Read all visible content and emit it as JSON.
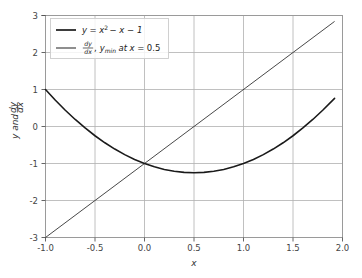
{
  "figure": {
    "background_color": "#ffffff",
    "axes_face_color": "#ffffff",
    "spine_color": "#aaaaaa",
    "grid_color": "#b0b0b0",
    "tick_color": "#555555",
    "curve_color": "#1a1a1a",
    "line_color": "#333333",
    "legend_face_color": "#ffffff",
    "legend_edge_color": "#cccccc"
  },
  "chart_data": {
    "type": "line",
    "title": "",
    "xlabel": "x",
    "ylabel": "y and dy/dx",
    "xlim": [
      -1.0,
      2.0
    ],
    "ylim": [
      -3.0,
      3.0
    ],
    "grid": true,
    "xticks": [
      -1.0,
      -0.5,
      0.0,
      0.5,
      1.0,
      1.5,
      2.0
    ],
    "xticklabels": [
      "-1.0",
      "-0.5",
      "0.0",
      "0.5",
      "1.0",
      "1.5",
      "2.0"
    ],
    "yticks": [
      -3,
      -2,
      -1,
      0,
      1,
      2,
      3
    ],
    "yticklabels": [
      "-3",
      "-2",
      "-1",
      "0",
      "1",
      "2",
      "3"
    ],
    "legend_position": "upper left",
    "annotations": {
      "minimum_x": 0.5,
      "minimum_y": -1.25,
      "roots_of_derivative": [
        0.5
      ]
    },
    "series": [
      {
        "name": "y = x² − x − 1",
        "equation": "y = x^2 - x - 1",
        "linewidth": 1.6,
        "color": "#1a1a1a",
        "x": [
          -1.0,
          -0.9,
          -0.8,
          -0.7,
          -0.6,
          -0.5,
          -0.4,
          -0.3,
          -0.2,
          -0.1,
          0.0,
          0.1,
          0.2,
          0.3,
          0.4,
          0.5,
          0.6,
          0.7,
          0.8,
          0.9,
          1.0,
          1.1,
          1.2,
          1.3,
          1.4,
          1.5,
          1.6,
          1.7,
          1.8,
          1.92
        ],
        "values": [
          1.0,
          0.71,
          0.44,
          0.19,
          -0.04,
          -0.25,
          -0.44,
          -0.61,
          -0.76,
          -0.89,
          -1.0,
          -1.09,
          -1.16,
          -1.21,
          -1.24,
          -1.25,
          -1.24,
          -1.21,
          -1.16,
          -1.09,
          -1.0,
          -0.89,
          -0.76,
          -0.61,
          -0.44,
          -0.25,
          -0.04,
          0.19,
          0.44,
          0.76
        ]
      },
      {
        "name": "dy/dx,  y_min at x = 0.5",
        "equation": "dy/dx = 2x - 1",
        "linewidth": 0.9,
        "color": "#333333",
        "x": [
          -1.0,
          1.92
        ],
        "values": [
          -3.0,
          2.84
        ]
      }
    ]
  },
  "legend": {
    "entries": [
      {
        "id": "legend-entry-function",
        "prefix": "y",
        "equals": "=",
        "base": "x",
        "exponent": "2",
        "rest": "− x − 1",
        "full_text": "y = x² − x − 1"
      },
      {
        "id": "legend-entry-derivative",
        "frac_num": "dy",
        "frac_den": "dx",
        "comma": ",",
        "y_symbol": "y",
        "y_sub": "min",
        "at_text": "at",
        "x_symbol": "x",
        "equals": "=",
        "value": "0.5",
        "full_text": "dy/dx,  y_min at x = 0.5"
      }
    ]
  }
}
